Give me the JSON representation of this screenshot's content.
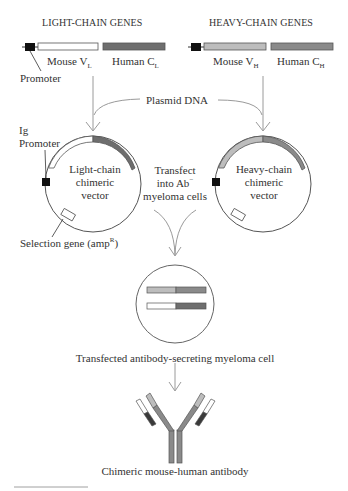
{
  "light_chain": {
    "header": "LIGHT-CHAIN GENES",
    "mouse_label": "Mouse V",
    "mouse_sub": "L",
    "human_label": "Human C",
    "human_sub": "L",
    "promoter_label": "Promoter"
  },
  "heavy_chain": {
    "header": "HEAVY-CHAIN GENES",
    "mouse_label": "Mouse V",
    "mouse_sub": "H",
    "human_label": "Human C",
    "human_sub": "H"
  },
  "plasmid_label": "Plasmid DNA",
  "light_vector": {
    "line1": "Light-chain",
    "line2": "chimeric",
    "line3": "vector",
    "ig_promoter_line1": "Ig",
    "ig_promoter_line2": "Promoter",
    "selection_label": "Selection gene (amp",
    "selection_sup": "R",
    "selection_close": ")"
  },
  "heavy_vector": {
    "line1": "Heavy-chain",
    "line2": "chimeric",
    "line3": "vector"
  },
  "transfect": {
    "line1": "Transfect",
    "line2": "into Ab",
    "line2_sup": "−",
    "line3": "myeloma cells"
  },
  "cell_label": "Transfected antibody-secreting myeloma cell",
  "antibody_label": "Chimeric mouse-human antibody",
  "colors": {
    "mouse_vl": "#ffffff",
    "human_cl": "#6e6e6e",
    "mouse_vh": "#bdbdbd",
    "human_ch": "#8a8a8a",
    "promoter": "#111111",
    "arrow": "#9a9a9a",
    "outline": "#555555"
  }
}
